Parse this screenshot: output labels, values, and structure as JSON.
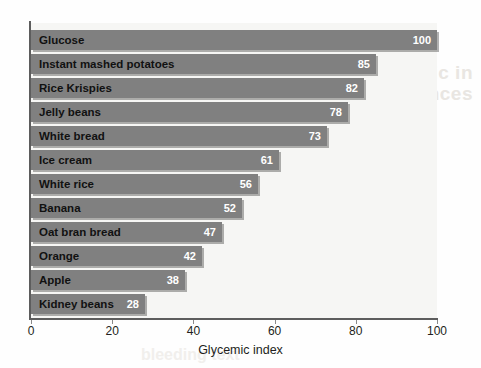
{
  "chart_data": {
    "type": "bar",
    "orientation": "horizontal",
    "title": "",
    "xlabel": "Glycemic index",
    "ylabel": "",
    "xlim": [
      0,
      100
    ],
    "xticks": [
      0,
      20,
      40,
      60,
      80,
      100
    ],
    "xtick_labels": [
      "0",
      "20",
      "40",
      "60",
      "80",
      "100"
    ],
    "grid": false,
    "legend": null,
    "bar_color": "#808080",
    "value_label_color": "#ffffff",
    "plot_background": "#f6f6f4",
    "categories": [
      "Glucose",
      "Instant mashed potatoes",
      "Rice Krispies",
      "Jelly beans",
      "White bread",
      "Ice cream",
      "White rice",
      "Banana",
      "Oat bran bread",
      "Orange",
      "Apple",
      "Kidney beans"
    ],
    "values": [
      100,
      85,
      82,
      78,
      73,
      61,
      56,
      52,
      47,
      42,
      38,
      28
    ],
    "value_labels": [
      "100",
      "85",
      "82",
      "78",
      "73",
      "61",
      "56",
      "52",
      "47",
      "42",
      "38",
      "28"
    ]
  },
  "artifacts": {
    "showthrough_line1": "nomic in",
    "showthrough_line2": "uences",
    "showthrough_line3": "bleeding text"
  }
}
